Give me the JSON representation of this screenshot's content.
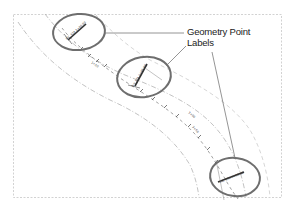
{
  "figure": {
    "callout": {
      "line1": "Geometry Point",
      "line2": "Labels"
    },
    "point_labels": [
      {
        "id": "label-1",
        "text": "P.C. STA 1+00.00"
      },
      {
        "id": "label-2",
        "text": "P.T. STA 2+85.00"
      },
      {
        "id": "label-3",
        "text": "P.C. STA 4+50.00"
      }
    ],
    "station_labels": [
      {
        "text": "1+50"
      },
      {
        "text": "3+00"
      },
      {
        "text": "3+50"
      }
    ],
    "colors": {
      "ellipse": "#6e6e6e",
      "frame": "#cfcfcf",
      "alignment": "#9a9a9a",
      "leader": "#7a7a7a",
      "text": "#222222"
    }
  }
}
